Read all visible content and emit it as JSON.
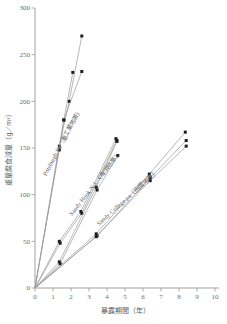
{
  "chart_data": {
    "type": "line",
    "title": "",
    "xlabel": "暴露期間（年）",
    "ylabel": "重量腐食減量（g／m²）",
    "xlim": [
      0,
      10
    ],
    "ylim": [
      0,
      300
    ],
    "xticks": [
      "0",
      "1",
      "2",
      "3",
      "4",
      "5",
      "6",
      "7",
      "8",
      "9",
      "10"
    ],
    "yticks": [
      "0",
      "50",
      "100",
      "150",
      "200",
      "250",
      "300"
    ],
    "grid": false,
    "legend_position": "inline-annotations",
    "annotations": [
      {
        "text": "Pittsburgh Pa（重工業地帯）",
        "x": 1.6,
        "y": 155
      },
      {
        "text": "Sandy Hook N.J.（海浜地帯）",
        "x": 3.4,
        "y": 110
      },
      {
        "text": "Sandy College pa（田園地帯）",
        "x": 5.2,
        "y": 95
      }
    ],
    "series": [
      {
        "name": "Pittsburgh Pa a",
        "group": "Pittsburgh Pa（重工業地帯）",
        "x": [
          0,
          1.35,
          1.9,
          2.6
        ],
        "y": [
          0,
          152,
          200,
          270
        ]
      },
      {
        "name": "Pittsburgh Pa b",
        "group": "Pittsburgh Pa（重工業地帯）",
        "x": [
          0,
          1.35,
          1.6,
          2.6
        ],
        "y": [
          0,
          148,
          180,
          232
        ]
      },
      {
        "name": "Pittsburgh Pa c",
        "group": "Pittsburgh Pa（重工業地帯）",
        "x": [
          0,
          1.6,
          2.1
        ],
        "y": [
          0,
          180,
          231
        ]
      },
      {
        "name": "Sandy Hook N.J. a",
        "group": "Sandy Hook N.J.（海浜地帯）",
        "x": [
          0,
          1.35,
          2.55,
          4.5
        ],
        "y": [
          0,
          50,
          82,
          160
        ]
      },
      {
        "name": "Sandy Hook N.J. b",
        "group": "Sandy Hook N.J.（海浜地帯）",
        "x": [
          0,
          1.4,
          2.6,
          4.55
        ],
        "y": [
          0,
          48,
          80,
          158
        ]
      },
      {
        "name": "Sandy Hook N.J. c",
        "group": "Sandy Hook N.J.（海浜地帯）",
        "x": [
          0,
          1.35,
          3.4,
          4.55
        ],
        "y": [
          0,
          28,
          108,
          157
        ]
      },
      {
        "name": "Sandy Hook N.J. d",
        "group": "Sandy Hook N.J.（海浜地帯）",
        "x": [
          0,
          1.4,
          3.45,
          4.6
        ],
        "y": [
          0,
          26,
          105,
          142
        ]
      },
      {
        "name": "Sandy College pa a",
        "group": "Sandy College pa（田園地帯）",
        "x": [
          0,
          3.4,
          6.35,
          8.35
        ],
        "y": [
          0,
          58,
          122,
          167
        ]
      },
      {
        "name": "Sandy College pa b",
        "group": "Sandy College pa（田園地帯）",
        "x": [
          0,
          3.45,
          6.4,
          8.4
        ],
        "y": [
          0,
          56,
          118,
          158
        ]
      },
      {
        "name": "Sandy College pa c",
        "group": "Sandy College pa（田園地帯）",
        "x": [
          0,
          3.4,
          6.4,
          8.4
        ],
        "y": [
          0,
          55,
          115,
          152
        ]
      }
    ]
  },
  "axes": {
    "x_title": "暴露期間（年）",
    "y_title": "重量腐食減量（g／m²）"
  }
}
